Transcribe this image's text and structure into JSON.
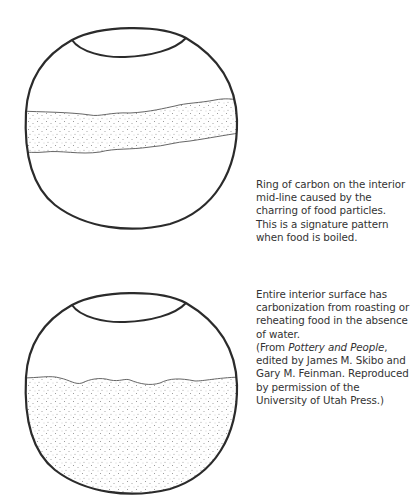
{
  "figures": [
    {
      "id": "pot-midline",
      "description": "Pot with ring of carbon on interior mid-line",
      "caption_lines": [
        "Ring of carbon on the interior",
        "mid-line caused by the",
        "charring of food particles.",
        "This is a signature pattern",
        "when food is boiled."
      ]
    },
    {
      "id": "pot-full-interior",
      "description": "Pot with carbonization over entire lower interior",
      "caption_lines": [
        "Entire interior surface has",
        "carbonization from roasting or",
        "reheating food in the absence",
        "of water."
      ]
    }
  ],
  "source": {
    "prefix": "(From ",
    "title": "Pottery and People",
    "lines_after_title": ",",
    "line2": "edited by James M. Skibo and",
    "line3": "Gary M. Feinman. Reproduced",
    "line4": "by permission of the",
    "line5": "University of Utah Press.)"
  },
  "colors": {
    "outline": "#2b2b2b",
    "stipple": "#8a8a8a",
    "text": "#333333"
  }
}
